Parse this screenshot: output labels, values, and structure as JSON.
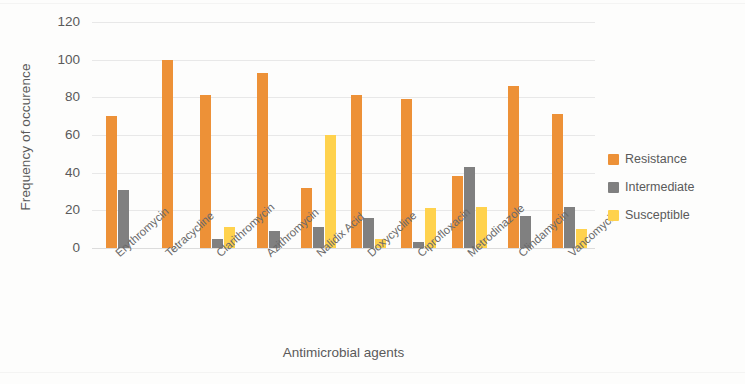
{
  "chart_data": {
    "type": "bar",
    "title": "",
    "xlabel": "Antimicrobial agents",
    "ylabel": "Frequency of occurence",
    "ylim": [
      0,
      120
    ],
    "ytick_step": 20,
    "yticks": [
      120,
      100,
      80,
      60,
      40,
      20,
      0
    ],
    "grid": true,
    "legend_position": "right",
    "categories": [
      "Erythromycin",
      "Tetracycline",
      "Clarithromycin",
      "Azithromycin",
      "Nalidix Acid",
      "Doxycycline",
      "Ciprofloxacin",
      "Metrodinazole",
      "Clindamycin",
      "Vancomycin"
    ],
    "series": [
      {
        "name": "Resistance",
        "color": "#ED9137",
        "values": [
          70,
          100,
          81,
          93,
          32,
          81,
          79,
          38,
          86,
          71
        ]
      },
      {
        "name": "Intermediate",
        "color": "#808080",
        "values": [
          31,
          0,
          5,
          9,
          11,
          16,
          3,
          43,
          17,
          22
        ]
      },
      {
        "name": "Susceptible",
        "color": "#FFD24D",
        "values": [
          0,
          0,
          11,
          0,
          60,
          5,
          21,
          22,
          0,
          10
        ]
      }
    ]
  },
  "legend": {
    "items": [
      {
        "label": "Resistance",
        "swatch": "orange-swatch"
      },
      {
        "label": "Intermediate",
        "swatch": "gray-swatch"
      },
      {
        "label": "Susceptible",
        "swatch": "yellow-swatch"
      }
    ]
  }
}
